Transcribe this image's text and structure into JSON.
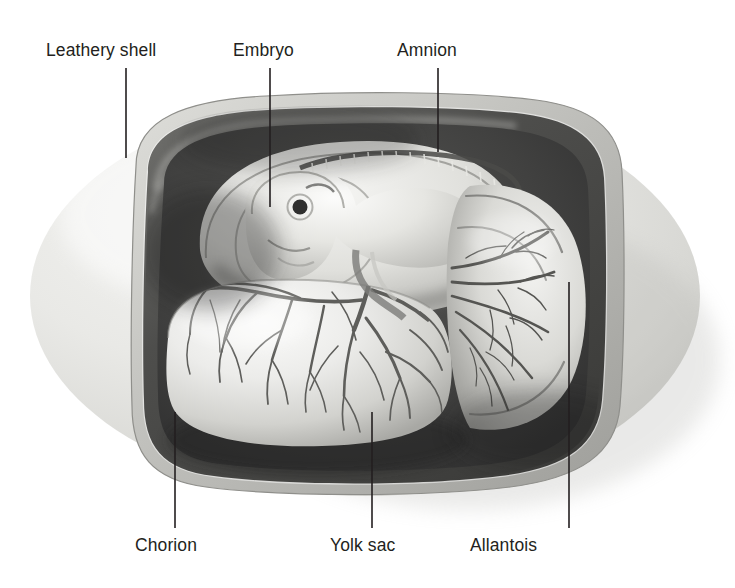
{
  "figure": {
    "style": "grayscale-airbrush-illustration",
    "background_color": "#ffffff",
    "ink_color": "#231f20",
    "canvas": {
      "width": 735,
      "height": 588
    }
  },
  "labels": [
    {
      "id": "leathery-shell",
      "text": "Leathery shell",
      "text_x": 46,
      "text_y": 40,
      "leader": {
        "x1": 126,
        "y1": 68,
        "x2": 126,
        "y2": 158
      }
    },
    {
      "id": "embryo",
      "text": "Embryo",
      "text_x": 233,
      "text_y": 40,
      "leader": {
        "x1": 270,
        "y1": 68,
        "x2": 270,
        "y2": 207
      }
    },
    {
      "id": "amnion",
      "text": "Amnion",
      "text_x": 397,
      "text_y": 40,
      "leader": {
        "x1": 438,
        "y1": 68,
        "x2": 438,
        "y2": 152
      }
    },
    {
      "id": "chorion",
      "text": "Chorion",
      "text_x": 135,
      "text_y": 535,
      "leader": {
        "x1": 175,
        "y1": 412,
        "x2": 175,
        "y2": 528
      }
    },
    {
      "id": "yolk-sac",
      "text": "Yolk sac",
      "text_x": 330,
      "text_y": 535,
      "leader": {
        "x1": 372,
        "y1": 412,
        "x2": 372,
        "y2": 528
      }
    },
    {
      "id": "allantois",
      "text": "Allantois",
      "text_x": 470,
      "text_y": 535,
      "leader": {
        "x1": 569,
        "y1": 282,
        "x2": 569,
        "y2": 528
      }
    }
  ],
  "structures": {
    "egg_outline": {
      "cx": 365,
      "cy": 296,
      "rx": 335,
      "ry": 200
    },
    "shell_tone": "#e8e8e6",
    "shell_shadow_tone": "#c9c9c6",
    "chorion_tone": "#4a4a4a",
    "cavity_tone": "#3d3d3d",
    "yolk_tone": "#e2e2de",
    "embryo_tone": "#dcdcd8",
    "vessel_tone": "#5a5a58"
  }
}
